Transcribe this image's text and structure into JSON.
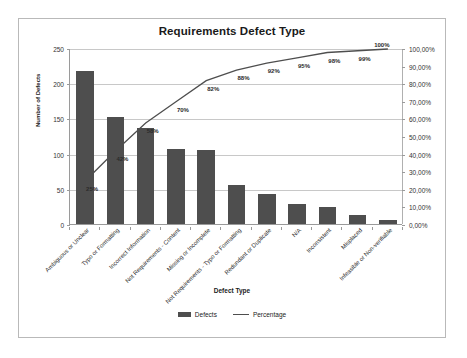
{
  "chart_data": {
    "type": "bar",
    "title": "Requirements Defect Type",
    "xlabel": "Defect Type",
    "ylabel": "Number of Defects",
    "y2label": "",
    "grid": true,
    "legend_position": "bottom",
    "ylim": [
      0,
      250
    ],
    "y2lim": [
      0,
      100
    ],
    "categories": [
      "Ambiguous or Unclear",
      "Typo or Formatting",
      "Incorrect Information",
      "Not Requirements - Content",
      "Missing or Incomplete",
      "Not Requirements - Typo or Formatting",
      "Redundant or Duplicate",
      "N/A",
      "Inconsistent",
      "Misplaced",
      "Infeasible or Non-verifiable"
    ],
    "series": [
      {
        "name": "Defects",
        "type": "bar",
        "color": "#4e4e4e",
        "values": [
          218,
          152,
          137,
          106,
          105,
          55,
          43,
          29,
          24,
          13,
          5
        ]
      },
      {
        "name": "Percentage",
        "type": "line",
        "color": "#4e4e4e",
        "values": [
          25,
          42,
          58,
          70,
          82,
          88,
          92,
          95,
          98,
          99,
          100
        ],
        "data_labels": [
          "25%",
          "42%",
          "58%",
          "70%",
          "82%",
          "88%",
          "92%",
          "95%",
          "98%",
          "99%",
          "100%"
        ]
      }
    ],
    "y_ticks": [
      0,
      50,
      100,
      150,
      200,
      250
    ],
    "y_tick_labels": [
      "0",
      "50",
      "100",
      "150",
      "200",
      "250"
    ],
    "y2_ticks": [
      0,
      10,
      20,
      30,
      40,
      50,
      60,
      70,
      80,
      90,
      100
    ],
    "y2_tick_labels": [
      "0,00%",
      "10,00%",
      "20,00%",
      "30,00%",
      "40,00%",
      "50,00%",
      "60,00%",
      "70,00%",
      "80,00%",
      "90,00%",
      "100,00%"
    ],
    "legend_entries": [
      "Defects",
      "Percentage"
    ]
  }
}
